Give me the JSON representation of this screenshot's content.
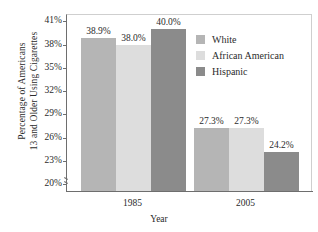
{
  "chart_data": {
    "type": "bar",
    "title": "",
    "xlabel": "Year",
    "ylabel": "Percentage of Americans 13 and Older Using Cigarettes",
    "ylabel_lines": [
      "Percentage of Americans",
      "13 and Older Using Cigarettes"
    ],
    "categories": [
      "1985",
      "2005"
    ],
    "series": [
      {
        "name": "White",
        "values": [
          38.9,
          27.3
        ],
        "color": "#b5b5b5",
        "labels": [
          "38.9%",
          "27.3%"
        ]
      },
      {
        "name": "African American",
        "values": [
          38.0,
          27.3
        ],
        "color": "#dddddd",
        "labels": [
          "38.0%",
          "27.3%"
        ]
      },
      {
        "name": "Hispanic",
        "values": [
          40.0,
          24.2
        ],
        "color": "#8b8b8b",
        "labels": [
          "40.0%",
          "24.2%"
        ]
      }
    ],
    "ylim": [
      19.0,
      41.8
    ],
    "y_ticks": [
      20,
      23,
      26,
      29,
      32,
      35,
      38,
      41
    ],
    "y_tick_labels": [
      "20%",
      "23%",
      "26%",
      "29%",
      "32%",
      "35%",
      "38%",
      "41%"
    ],
    "grid": false,
    "axis_break": true,
    "legend_position": "inside-upper-right"
  },
  "legend": {
    "items": [
      {
        "label": "White"
      },
      {
        "label": "African American"
      },
      {
        "label": "Hispanic"
      }
    ]
  }
}
